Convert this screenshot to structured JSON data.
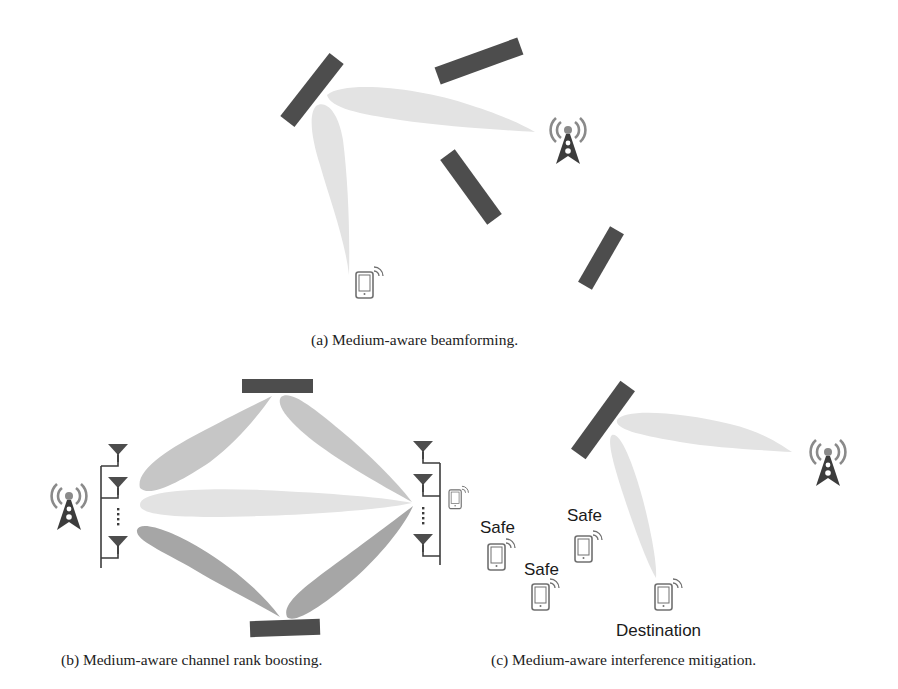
{
  "colors": {
    "reflector": "#4d4d4d",
    "beam_light": "#e3e3e3",
    "beam_mid": "#c6c6c6",
    "beam_dark": "#a6a6a6",
    "icon": "#3c3c3c",
    "icon_waves": "#8a8a8a",
    "device": "#707070"
  },
  "panels": {
    "a": {
      "caption": "(a)  Medium-aware beamforming.",
      "elements": [
        "base-station",
        "mobile-device",
        "reflector",
        "reflector",
        "reflector",
        "reflector"
      ]
    },
    "b": {
      "caption": "(b)  Medium-aware channel rank boosting.",
      "elements": [
        "base-station",
        "transmit-antenna-array",
        "receive-antenna-array",
        "mobile-device",
        "reflector-top",
        "reflector-bottom"
      ]
    },
    "c": {
      "caption": "(c)  Medium-aware interference mitigation.",
      "labels": {
        "safe_1": "Safe",
        "safe_2": "Safe",
        "safe_3": "Safe",
        "destination": "Destination"
      }
    }
  },
  "icons": {
    "base_station": "cell-tower-icon",
    "device": "smartphone-icon",
    "antenna": "antenna-icon"
  }
}
